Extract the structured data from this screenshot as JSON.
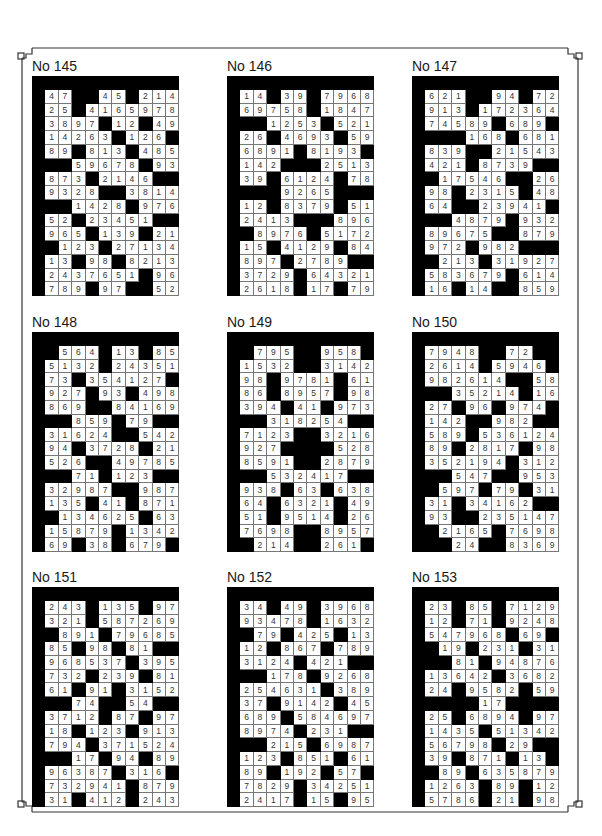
{
  "page": {
    "legend": {
      "digit": "white cell with digit",
      "#": "black cell"
    },
    "puzzles": [
      {
        "title": "No 145",
        "rows": [
          "47##45#214",
          "25#4165978",
          "3897#12#49",
          "14263#126#",
          "89#813#485",
          "##59678#93",
          "873#2146##",
          "9328##3814",
          "##1428#976",
          "52#23451##",
          "965#139#21",
          "#123#27134",
          "13#98#8213",
          "2437651#96",
          "789#97##52"
        ]
      },
      {
        "title": "No 146",
        "rows": [
          "14#39#7968",
          "69758#1847",
          "##1253#521",
          "26#4693#59",
          "6891#8193#",
          "142###2513",
          "39#6124#78",
          "###9265###",
          "12#8379#51",
          "2413###896",
          "#8976#5172",
          "15#4129#84",
          "897#2789##",
          "3729#64321",
          "2618#17#79"
        ]
      },
      {
        "title": "No 147",
        "rows": [
          "621##94#72",
          "913#172364",
          "74589#689#",
          "###168#681",
          "839##21543",
          "421#8739##",
          "#17546##26",
          "98#2315#48",
          "64##23941#",
          "##4879#932",
          "89675##879",
          "972#982###",
          "#213#31927",
          "583679#614",
          "16#14##859"
        ]
      },
      {
        "title": "No 148",
        "rows": [
          "#564#13#85",
          "5132#24351",
          "73#354127#",
          "927#93#498",
          "869##84169",
          "##859#79##",
          "31624##542",
          "94#3728#21",
          "526##49785",
          "##71#123##",
          "32987##987",
          "135#41#871",
          "#134625#63",
          "15879#1342",
          "69#38#679#"
        ]
      },
      {
        "title": "No 149",
        "rows": [
          "#795##958#",
          "1532##3142",
          "98#9781#61",
          "86#8957#98",
          "394#41#973",
          "##318254##",
          "7123##3216",
          "927####528",
          "8591##2879",
          "##532417##",
          "938#63#638",
          "64#6321#49",
          "51#9514#26",
          "7698##8957",
          "#214##261#"
        ]
      },
      {
        "title": "No 150",
        "rows": [
          "7948##72##",
          "2614#5946#",
          "982614##58",
          "##35214#16",
          "27#96#974#",
          "142##982##",
          "589#536124",
          "89#2817#98",
          "352194#312",
          "##547##953",
          "#597#79#31",
          "31#34162##",
          "93##235147",
          "#2165#7698",
          "##24##8369"
        ]
      },
      {
        "title": "No 151",
        "rows": [
          "243#135#97",
          "321#587269",
          "#891#79685",
          "85#98#81##",
          "968537#395",
          "732#239#81",
          "61#91#3152",
          "##74##54##",
          "3712#87#97",
          "18#123#913",
          "794#371524",
          "##17#94#89",
          "96387#316#",
          "732941#879",
          "31#412#243"
        ]
      },
      {
        "title": "No 152",
        "rows": [
          "34#49#3968",
          "93478#1632",
          "#79#425#13",
          "12#867#789",
          "3124#421##",
          "##178#9268",
          "254631#389",
          "37#9142#45",
          "689#584697",
          "8974#231##",
          "##215#6987",
          "123#851#61",
          "89#192#57#",
          "7829#34251",
          "2417#15#95"
        ]
      },
      {
        "title": "No 153",
        "rows": [
          "23#85#7129",
          "12#71#9248",
          "547968#69#",
          "#19#231#31",
          "##81#94876",
          "13642#3682",
          "24#9582#59",
          "####17####",
          "25#6894#97",
          "1435#51342",
          "56798#29##",
          "39#871#13#",
          "#89#635879",
          "1263#89#12",
          "5786#21#98"
        ]
      }
    ]
  }
}
